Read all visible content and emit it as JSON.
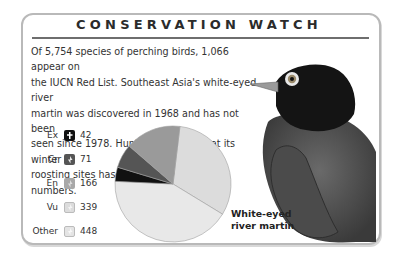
{
  "header": {
    "title": "CONSERVATION WATCH"
  },
  "body": {
    "lines": [
      "Of 5,754 species of perching birds, 1,066 appear on",
      "the IUCN Red List. Southeast Asia's white-eyed river",
      "martin was discovered in 1968 and has not been",
      "seen since 1978. Hunting of this bird at its winter",
      "roosting sites has probably reduced its numbers."
    ]
  },
  "legend": [
    {
      "label": "Ex",
      "value": "42",
      "color": "#111111",
      "icon": "extinct-icon"
    },
    {
      "label": "Cr",
      "value": "71",
      "color": "#555555",
      "icon": "critical-icon"
    },
    {
      "label": "En",
      "value": "166",
      "color": "#9a9a9a",
      "icon": "endangered-icon"
    },
    {
      "label": "Vu",
      "value": "339",
      "color": "#d2d2d2",
      "icon": "vulnerable-icon"
    },
    {
      "label": "Other",
      "value": "448",
      "color": "#e6e6e6",
      "icon": "other-icon"
    }
  ],
  "caption": {
    "line1": "White-eyed",
    "line2": "river martin"
  },
  "chart_data": {
    "type": "pie",
    "title": "",
    "categories": [
      "Ex",
      "Cr",
      "En",
      "Vu",
      "Other"
    ],
    "values": [
      42,
      71,
      166,
      339,
      448
    ],
    "colors": [
      "#111111",
      "#555555",
      "#9a9a9a",
      "#dcdcdc",
      "#e8e8e8"
    ],
    "legend_position": "left"
  }
}
